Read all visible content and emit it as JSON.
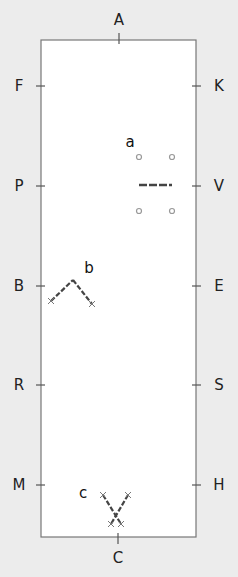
{
  "diagram": {
    "type": "dressage-arena",
    "colors": {
      "background": "#ececec",
      "arena": "#ffffff",
      "border": "#777777",
      "pole": "#555555",
      "cone": "#999999"
    },
    "markers": [
      {
        "letter": "A",
        "x": 119,
        "y": 20
      },
      {
        "letter": "F",
        "x": 19,
        "y": 86
      },
      {
        "letter": "K",
        "x": 219,
        "y": 86
      },
      {
        "letter": "P",
        "x": 19,
        "y": 186
      },
      {
        "letter": "V",
        "x": 219,
        "y": 186
      },
      {
        "letter": "B",
        "x": 19,
        "y": 286
      },
      {
        "letter": "E",
        "x": 219,
        "y": 286
      },
      {
        "letter": "R",
        "x": 19,
        "y": 385
      },
      {
        "letter": "S",
        "x": 219,
        "y": 385
      },
      {
        "letter": "M",
        "x": 19,
        "y": 485
      },
      {
        "letter": "H",
        "x": 219,
        "y": 485
      },
      {
        "letter": "C",
        "x": 118,
        "y": 558
      }
    ],
    "exercises": [
      {
        "label": "a",
        "x": 130,
        "y": 142,
        "description": "Single pole between four cones"
      },
      {
        "label": "b",
        "x": 89,
        "y": 268,
        "description": "Two poles in an inverted V"
      },
      {
        "label": "c",
        "x": 83,
        "y": 493,
        "description": "Two crossed poles forming an X"
      }
    ]
  }
}
